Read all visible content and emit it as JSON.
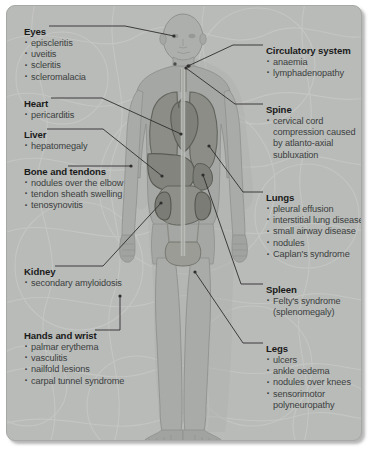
{
  "diagram": {
    "colors": {
      "panel_background": "#b9bbb8",
      "panel_border": "#a7a9a6",
      "title_text": "#1a1a1a",
      "body_text": "#3b3e40",
      "leader_line": "#2e2e2e",
      "body_silhouette": "#a9aba8",
      "organ_fill": "#8d8f8c"
    },
    "left_callouts": [
      {
        "id": "eyes",
        "title": "Eyes",
        "items": [
          "episcleritis",
          "uveitis",
          "scleritis",
          "scleromalacia"
        ]
      },
      {
        "id": "heart",
        "title": "Heart",
        "items": [
          "pericarditis"
        ]
      },
      {
        "id": "liver",
        "title": "Liver",
        "items": [
          "hepatomegaly"
        ]
      },
      {
        "id": "bone-and-tendons",
        "title": "Bone and tendons",
        "items": [
          "nodules over the elbow",
          "tendon sheath swelling",
          "tenosynovitis"
        ]
      },
      {
        "id": "kidney",
        "title": "Kidney",
        "items": [
          "secondary amyloidosis"
        ]
      },
      {
        "id": "hands-and-wrist",
        "title": "Hands and wrist",
        "items": [
          "palmar erythema",
          "vasculitis",
          "nailfold lesions",
          "carpal tunnel syndrome"
        ]
      }
    ],
    "right_callouts": [
      {
        "id": "circulatory-system",
        "title": "Circulatory system",
        "items": [
          "anaemia",
          "lymphadenopathy"
        ]
      },
      {
        "id": "spine",
        "title": "Spine",
        "items": [
          "cervical cord compression caused by atlanto-axial subluxation"
        ]
      },
      {
        "id": "lungs",
        "title": "Lungs",
        "items": [
          "pleural effusion",
          "interstitial lung disease",
          "small airway disease",
          "nodules",
          "Caplan's syndrome"
        ]
      },
      {
        "id": "spleen",
        "title": "Spleen",
        "items": [
          "Felty's syndrome (splenomegaly)"
        ]
      },
      {
        "id": "legs",
        "title": "Legs",
        "items": [
          "ulcers",
          "ankle oedema",
          "nodules over knees",
          "sensorimotor polyneuropathy"
        ]
      }
    ]
  }
}
